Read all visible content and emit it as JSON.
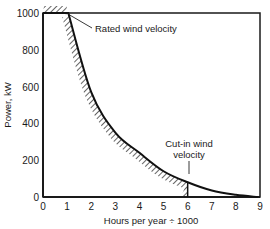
{
  "chart_data": {
    "type": "line",
    "title": "",
    "xlabel": "Hours per year ÷ 1000",
    "ylabel": "Power, kW",
    "xlim": [
      0,
      9
    ],
    "ylim": [
      0,
      1000
    ],
    "x_ticks": [
      "0",
      "1",
      "2",
      "3",
      "4",
      "5",
      "6",
      "7",
      "8",
      "9"
    ],
    "y_ticks": [
      "0",
      "200",
      "400",
      "600",
      "800",
      "1000"
    ],
    "grid": false,
    "legend": null,
    "series": [
      {
        "name": "Power duration curve",
        "x": [
          0,
          1.05,
          2,
          3,
          4,
          5,
          6,
          7,
          8,
          8.9
        ],
        "y": [
          1000,
          1000,
          570,
          350,
          240,
          140,
          80,
          35,
          12,
          0
        ]
      }
    ],
    "shaded_region": {
      "description": "Hatched area under curve",
      "x_from": 0,
      "x_to": 6
    },
    "annotations": [
      {
        "text": "Rated wind velocity",
        "points_to": [
          1.05,
          1000
        ]
      },
      {
        "text_lines": [
          "Cut-in wind",
          "velocity"
        ],
        "points_to": [
          6,
          80
        ]
      }
    ]
  }
}
